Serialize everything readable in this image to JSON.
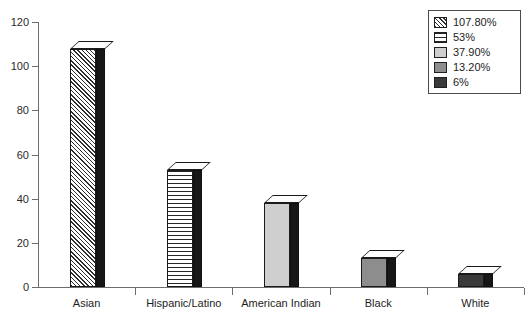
{
  "chart_data": {
    "type": "bar",
    "title": "",
    "xlabel": "",
    "ylabel": "",
    "categories": [
      "Asian",
      "Hispanic/Latino",
      "American Indian",
      "Black",
      "White"
    ],
    "values": [
      107.8,
      53,
      37.9,
      13.2,
      6
    ],
    "value_labels": [
      "107.80%",
      "53%",
      "37.90%",
      "13.20%",
      "6%"
    ],
    "ylim": [
      0,
      120
    ],
    "yticks": [
      0,
      20,
      40,
      60,
      80,
      100,
      120
    ],
    "ytick_labels": [
      "0",
      "20",
      "40",
      "60",
      "80",
      "100",
      "120"
    ],
    "grid": false,
    "legend_position": "top-right",
    "style": "3d-columns",
    "series": [
      {
        "name": "percent",
        "values": [
          107.8,
          53,
          37.9,
          13.2,
          6
        ]
      }
    ],
    "bar_patterns": [
      "diagonal-hatch",
      "horizontal-lines",
      "light-gray",
      "medium-gray",
      "dark-gray"
    ]
  },
  "legend": {
    "items": [
      {
        "label": "107.80%",
        "pattern": "diagonal-hatch"
      },
      {
        "label": "53%",
        "pattern": "horizontal-lines"
      },
      {
        "label": "37.90%",
        "pattern": "light-gray"
      },
      {
        "label": "13.20%",
        "pattern": "medium-gray"
      },
      {
        "label": "6%",
        "pattern": "dark-gray"
      }
    ]
  },
  "colors": {
    "axis": "#6d6d6d",
    "text": "#1d1d1d",
    "bar_side": "#171717",
    "bar_top": "#fdfdfd",
    "light_gray": "#cfcfcf",
    "medium_gray": "#8d8d8d",
    "dark_gray": "#3a3a3a",
    "background": "#ffffff"
  }
}
